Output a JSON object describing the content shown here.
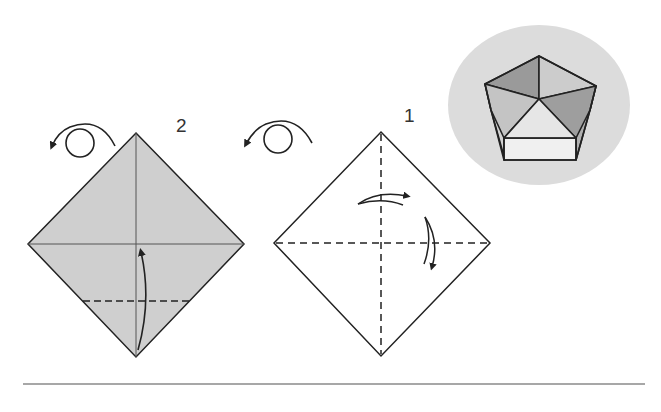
{
  "diagram": {
    "colors": {
      "paper_gray": "#cfcfcf",
      "paper_white": "#ffffff",
      "line": "#222222",
      "badge_bg": "#dcdcdc",
      "pentagon_dark": "#9a9a9a",
      "pentagon_mid": "#c4c4c4",
      "pentagon_light": "#e6e6e6",
      "rule": "#8a8a8a"
    },
    "steps": [
      {
        "number": "1",
        "label_pos": [
          404,
          108
        ],
        "shape": "diamond",
        "fill": "white",
        "vertices": {
          "top": [
            381,
            132
          ],
          "left": [
            274,
            243
          ],
          "right": [
            490,
            243
          ],
          "bottom": [
            381,
            356
          ]
        },
        "fold_lines": [
          {
            "type": "valley-dashed",
            "from": [
              381,
              132
            ],
            "to": [
              381,
              356
            ]
          },
          {
            "type": "valley-dashed",
            "from": [
              274,
              243
            ],
            "to": [
              490,
              243
            ]
          }
        ],
        "arrows": [
          "fold-right-arrow",
          "fold-down-arrow"
        ],
        "turn_over_icon": true
      },
      {
        "number": "2",
        "label_pos": [
          176,
          116
        ],
        "shape": "diamond",
        "fill": "gray",
        "vertices": {
          "top": [
            136,
            133
          ],
          "left": [
            28,
            244
          ],
          "right": [
            244,
            244
          ],
          "bottom": [
            136,
            357
          ]
        },
        "fold_lines": [
          {
            "type": "crease",
            "from": [
              136,
              133
            ],
            "to": [
              136,
              357
            ]
          },
          {
            "type": "crease",
            "from": [
              28,
              244
            ],
            "to": [
              244,
              244
            ]
          },
          {
            "type": "valley-dashed",
            "from": [
              83,
              301
            ],
            "to": [
              190,
              301
            ]
          }
        ],
        "arrows": [
          "fold-up-arrow"
        ],
        "turn_over_icon": true
      }
    ],
    "result_badge": {
      "shape": "ellipse",
      "center": [
        539,
        105
      ],
      "content": "finished pentagon box (top view)"
    },
    "bottom_rule": {
      "y": 384,
      "x1": 23,
      "x2": 645
    }
  }
}
